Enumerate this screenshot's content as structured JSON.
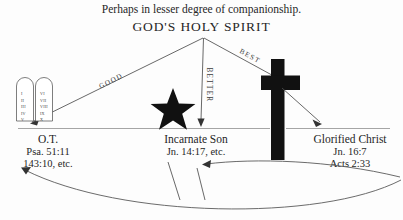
{
  "caption": {
    "top_note": "Perhaps in lesser degree of companionship.",
    "heading": "GOD'S HOLY SPIRIT"
  },
  "edges": [
    {
      "id": "good",
      "label": "GOOD",
      "from": "heading",
      "to": "ot"
    },
    {
      "id": "better",
      "label": "BETTER",
      "from": "heading",
      "to": "incarnate-son"
    },
    {
      "id": "best",
      "label": "BEST",
      "from": "heading",
      "to": "glorified-christ"
    }
  ],
  "nodes": [
    {
      "id": "ot",
      "icon": "stone-tablets-icon",
      "title": "O.T.",
      "refs": [
        "Psa. 51:11",
        "143:10, etc."
      ]
    },
    {
      "id": "incarnate-son",
      "icon": "star-icon",
      "title": "Incarnate Son",
      "refs": [
        "Jn. 14:17, etc."
      ]
    },
    {
      "id": "glorified-christ",
      "icon": "cross-icon",
      "title": "Glorified Christ",
      "refs": [
        "Jn. 16:7",
        "Acts 2:33"
      ]
    }
  ],
  "tablets": {
    "left_numerals": [
      "I",
      "II",
      "III",
      "IV",
      "V"
    ],
    "right_numerals": [
      "VI",
      "VII",
      "VIII",
      "IX",
      "X"
    ]
  },
  "return_arrows": [
    {
      "id": "return-to-incarnate",
      "from": "glorified-christ",
      "to": "incarnate-son"
    },
    {
      "id": "return-to-ot",
      "from": "glorified-christ",
      "to": "ot"
    }
  ],
  "colors": {
    "ink": "#1a1a1a",
    "line": "#4d4d4d",
    "solid": "#111111",
    "background": "#fdfdfd"
  }
}
